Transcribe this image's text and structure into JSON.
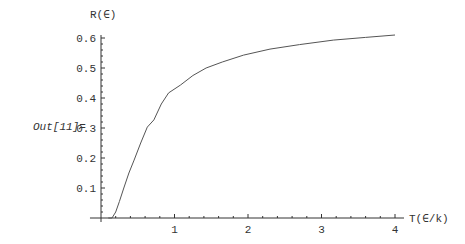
{
  "cell": {
    "output_label": "Out[11]="
  },
  "chart_data": {
    "type": "line",
    "title": "",
    "xlabel": "T(∈/k)",
    "ylabel": "R(∈)",
    "xlim": [
      0,
      4
    ],
    "ylim": [
      0,
      0.6
    ],
    "x_ticks": [
      1,
      2,
      3,
      4
    ],
    "x_tick_labels": [
      "1",
      "2",
      "3",
      "4"
    ],
    "y_ticks": [
      0.1,
      0.2,
      0.3,
      0.4,
      0.5,
      0.6
    ],
    "y_tick_labels": [
      "0.1",
      "0.2",
      "0.3",
      "0.4",
      "0.5",
      "0.6"
    ],
    "grid": false,
    "line_color": "#555555",
    "series": [
      {
        "name": "R",
        "x": [
          0.1,
          0.15,
          0.2,
          0.25,
          0.31,
          0.38,
          0.45,
          0.54,
          0.63,
          0.72,
          0.82,
          0.92,
          1.08,
          1.25,
          1.43,
          1.65,
          1.94,
          2.3,
          2.7,
          3.16,
          3.6,
          4.0
        ],
        "y": [
          0.0,
          0.0,
          0.02,
          0.055,
          0.1,
          0.15,
          0.193,
          0.25,
          0.303,
          0.327,
          0.38,
          0.417,
          0.443,
          0.475,
          0.5,
          0.52,
          0.543,
          0.563,
          0.578,
          0.593,
          0.602,
          0.61
        ]
      }
    ]
  }
}
